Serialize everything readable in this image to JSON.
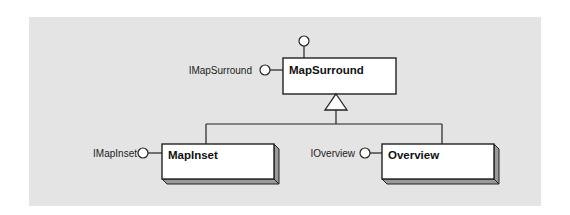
{
  "diagram": {
    "type": "UML class diagram",
    "background_color": "#e4e4e4",
    "box_fill": "#ffffff",
    "shadow_color": "#9a9a9a",
    "line_color": "#222222",
    "classes": [
      {
        "name": "MapSurround",
        "role": "parent",
        "style": "plain",
        "interfaces": [
          {
            "label": "",
            "position": "top"
          },
          {
            "label": "IMapSurround",
            "position": "left"
          }
        ]
      },
      {
        "name": "MapInset",
        "role": "child",
        "style": "3d",
        "interfaces": [
          {
            "label": "IMapInset",
            "position": "left"
          }
        ]
      },
      {
        "name": "Overview",
        "role": "child",
        "style": "3d",
        "interfaces": [
          {
            "label": "IOverview",
            "position": "left"
          }
        ]
      }
    ],
    "relationships": [
      {
        "type": "inheritance",
        "from": "MapInset",
        "to": "MapSurround"
      },
      {
        "type": "inheritance",
        "from": "Overview",
        "to": "MapSurround"
      }
    ]
  },
  "labels": {
    "map_surround": "MapSurround",
    "i_map_surround": "IMapSurround",
    "map_inset": "MapInset",
    "i_map_inset": "IMapInset",
    "overview": "Overview",
    "i_overview": "IOverview"
  }
}
